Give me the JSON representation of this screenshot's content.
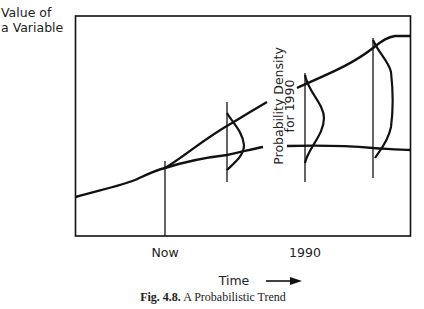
{
  "figure": {
    "y_axis_label_line1": "Value of",
    "y_axis_label_line2": "a Variable",
    "x_tick_now": "Now",
    "x_tick_1990": "1990",
    "x_axis_label": "Time",
    "density_label_line1": "Probability Density",
    "density_label_line2": "for 1990",
    "caption_number": "Fig. 4.8.",
    "caption_text": "A Probabilistic Trend"
  },
  "icons": {
    "arrow": "right-arrow-icon"
  }
}
